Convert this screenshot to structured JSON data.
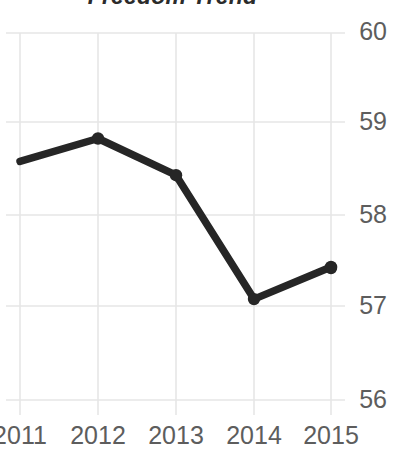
{
  "chart_data": {
    "type": "line",
    "title": "Freedom Trend",
    "xlabel": "",
    "ylabel": "",
    "categories": [
      "2011",
      "2012",
      "2013",
      "2014",
      "2015"
    ],
    "x": [
      2011,
      2012,
      2013,
      2014,
      2015
    ],
    "values": [
      58.6,
      58.85,
      58.45,
      57.1,
      57.45
    ],
    "series": [
      {
        "name": "Freedom Trend",
        "values": [
          58.6,
          58.85,
          58.45,
          57.1,
          57.45
        ]
      }
    ],
    "ylim": [
      56,
      60
    ],
    "yticks": [
      60,
      59,
      58,
      57,
      56
    ],
    "ytick_labels": [
      "60",
      "59",
      "58",
      "57",
      "56"
    ],
    "xticks": [
      2011,
      2012,
      2013,
      2014,
      2015
    ],
    "xtick_labels": [
      "2011",
      "2012",
      "2013",
      "2014",
      "2015"
    ],
    "grid": true,
    "grid_color": "#e6e6e6",
    "legend": false,
    "legend_position": "none",
    "line_color": "#262626",
    "marker": "circle",
    "marker_color": "#262626",
    "background_color": "#ffffff",
    "tick_label_color": "#5d5d5d",
    "title_color": "#2b2b2b",
    "y_axis_position": "right"
  },
  "axis": {
    "y_labels": [
      "60",
      "59",
      "58",
      "57",
      "56"
    ],
    "x_labels": [
      "2011",
      "2012",
      "2013",
      "2014",
      "2015"
    ]
  }
}
